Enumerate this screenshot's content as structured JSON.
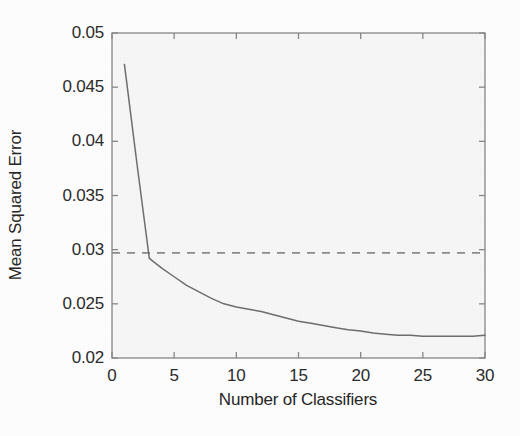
{
  "chart_data": {
    "type": "line",
    "title": "",
    "xlabel": "Number of Classifiers",
    "ylabel": "Mean Squared Error",
    "xlim": [
      0,
      30
    ],
    "ylim": [
      0.02,
      0.05
    ],
    "grid": false,
    "legend": null,
    "xticks": [
      0,
      5,
      10,
      15,
      20,
      25,
      30
    ],
    "xtick_labels": [
      "0",
      "5",
      "10",
      "15",
      "20",
      "25",
      "30"
    ],
    "yticks": [
      0.02,
      0.025,
      0.03,
      0.035,
      0.04,
      0.045,
      0.05
    ],
    "ytick_labels": [
      "0.02",
      "0.025",
      "0.03",
      "0.035",
      "0.04",
      "0.045",
      "0.05"
    ],
    "series": [
      {
        "name": "ensemble-mse",
        "style": "solid",
        "color": "#6e6e6e",
        "x": [
          1,
          2,
          3,
          4,
          5,
          6,
          7,
          8,
          9,
          10,
          11,
          12,
          13,
          14,
          15,
          16,
          17,
          18,
          19,
          20,
          21,
          22,
          23,
          24,
          25,
          26,
          27,
          28,
          29,
          30
        ],
        "values": [
          0.0471,
          0.038,
          0.0292,
          0.0283,
          0.0275,
          0.0267,
          0.0261,
          0.0255,
          0.025,
          0.0247,
          0.0245,
          0.0243,
          0.024,
          0.0237,
          0.0234,
          0.0232,
          0.023,
          0.0228,
          0.0226,
          0.0225,
          0.0223,
          0.0222,
          0.0221,
          0.0221,
          0.022,
          0.022,
          0.022,
          0.022,
          0.022,
          0.0221
        ]
      },
      {
        "name": "baseline-reference",
        "style": "dashed",
        "color": "#8c8c8c",
        "constant_y": 0.0297,
        "x": [
          0,
          30
        ],
        "values": [
          0.0297,
          0.0297
        ]
      }
    ]
  }
}
